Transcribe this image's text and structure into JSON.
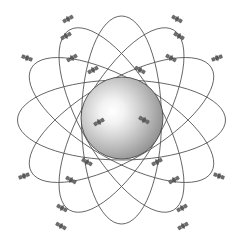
{
  "figure": {
    "background_color": "#ffffff",
    "width": 243,
    "height": 244,
    "caption_text": ""
  },
  "central_body": {
    "name": "earth-sphere",
    "center_x": 122,
    "center_y": 118,
    "radius": 41,
    "outline_color": "#4a4a4a",
    "highlight_color": "#ffffff",
    "midtone_color": "#c9c9c9",
    "shadow_color": "#8a8a8a",
    "highlight_offset_x": "38%",
    "highlight_offset_y": "42%"
  },
  "orbits": {
    "stroke_color": "#4a4a4a",
    "stroke_width": 0.85,
    "count": 6,
    "paths": [
      {
        "id": "orbit-1",
        "rx": 104,
        "ry": 40,
        "rotation": 0,
        "satellites": 6
      },
      {
        "id": "orbit-2",
        "rx": 104,
        "ry": 40,
        "rotation": 30,
        "satellites": 6
      },
      {
        "id": "orbit-3",
        "rx": 104,
        "ry": 40,
        "rotation": 60,
        "satellites": 6
      },
      {
        "id": "orbit-4",
        "rx": 104,
        "ry": 40,
        "rotation": 90,
        "satellites": 6
      },
      {
        "id": "orbit-5",
        "rx": 104,
        "ry": 40,
        "rotation": 120,
        "satellites": 6
      },
      {
        "id": "orbit-6",
        "rx": 104,
        "ry": 40,
        "rotation": 150,
        "satellites": 6
      }
    ]
  },
  "satellites": {
    "icon_name": "satellite-icon",
    "body_color": "#595959",
    "panel_color": "#707070",
    "total_visible": 24,
    "markers": [
      {
        "x": 68,
        "y": 19,
        "angle": -28
      },
      {
        "x": 66,
        "y": 36,
        "angle": -28
      },
      {
        "x": 27,
        "y": 58,
        "angle": 20
      },
      {
        "x": 72,
        "y": 58,
        "angle": -28
      },
      {
        "x": 93,
        "y": 70,
        "angle": -28
      },
      {
        "x": 177,
        "y": 19,
        "angle": 28
      },
      {
        "x": 179,
        "y": 36,
        "angle": 28
      },
      {
        "x": 217,
        "y": 58,
        "angle": -20
      },
      {
        "x": 171,
        "y": 58,
        "angle": 28
      },
      {
        "x": 140,
        "y": 70,
        "angle": 28
      },
      {
        "x": 99,
        "y": 122,
        "angle": -28
      },
      {
        "x": 144,
        "y": 120,
        "angle": 28
      },
      {
        "x": 87,
        "y": 162,
        "angle": 28
      },
      {
        "x": 71,
        "y": 180,
        "angle": 28
      },
      {
        "x": 24,
        "y": 176,
        "angle": -20
      },
      {
        "x": 62,
        "y": 208,
        "angle": 28
      },
      {
        "x": 61,
        "y": 226,
        "angle": 28
      },
      {
        "x": 157,
        "y": 162,
        "angle": -28
      },
      {
        "x": 174,
        "y": 180,
        "angle": -28
      },
      {
        "x": 219,
        "y": 176,
        "angle": 20
      },
      {
        "x": 182,
        "y": 208,
        "angle": -28
      },
      {
        "x": 183,
        "y": 226,
        "angle": -28
      }
    ]
  },
  "chart_data": {
    "type": "diagram",
    "elements": {
      "central_sphere": 1,
      "orbital_planes": 6,
      "satellite_markers": 22
    }
  }
}
